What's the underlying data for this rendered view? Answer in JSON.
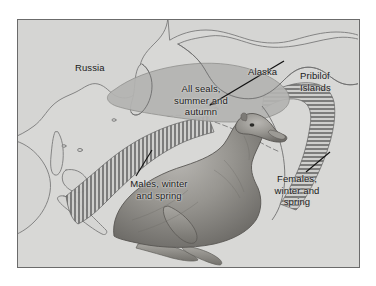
{
  "figure": {
    "background_color": "#ffffff",
    "map_background_color": "#d8d8d6",
    "map_border_color": "#6b6b6b",
    "coastline_color": "#7a7a7a",
    "hatch_color": "#4a4a4a",
    "all_seals_fill": "#b4b4b2",
    "label_color": "#1a1a1a"
  },
  "labels": {
    "russia": "Russia",
    "alaska": "Alaska",
    "pribilof_islands": "Pribilof Islands",
    "all_seals": "All seals,\nsummer and\nautumn",
    "males": "Males, winter\nand spring",
    "females": "Females,\nwinter and\nspring"
  },
  "legend_semantics": {
    "all_seals_region": "solid gray shaded area, summer and autumn range",
    "males_region": "vertical hatching, winter and spring range (western Pacific)",
    "females_region": "horizontal hatching, winter and spring range (eastern Pacific)",
    "pribilof_islands": "breeding colony location indicated by arrow"
  },
  "illustration": {
    "subject": "northern fur seal",
    "position": "bottom center"
  }
}
